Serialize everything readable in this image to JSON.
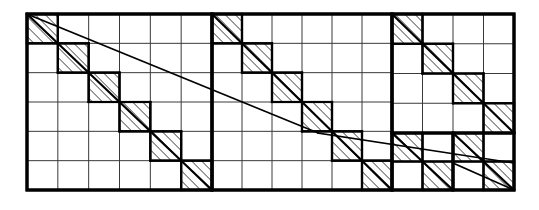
{
  "figure": {
    "type": "diagram",
    "canvas": {
      "width": 539,
      "height": 210
    },
    "frame": {
      "x": 27,
      "y": 14,
      "width": 487,
      "height": 176
    },
    "colors": {
      "background": "#ffffff",
      "stroke_heavy": "#000000",
      "stroke_light": "#3a3a3a",
      "hatch": "#000000"
    },
    "stroke_widths": {
      "outer_frame": 3.0,
      "panel_divider": 3.0,
      "cell_border_heavy": 2.2,
      "grid_line": 1.0,
      "diagonal": 2.2,
      "shallow_line": 1.6
    },
    "panels": [
      {
        "id": "panel-1",
        "label": "left panel",
        "x": 27,
        "y": 14,
        "width": 185,
        "height": 176,
        "grid": {
          "cols": 6,
          "rows": 6
        },
        "hatched_cells": [
          [
            0,
            0
          ],
          [
            1,
            1
          ],
          [
            2,
            2
          ],
          [
            3,
            3
          ],
          [
            4,
            4
          ],
          [
            5,
            5
          ]
        ],
        "diagonal": {
          "from": [
            0,
            0
          ],
          "to": [
            6,
            6
          ]
        }
      },
      {
        "id": "panel-2",
        "label": "middle panel",
        "x": 212,
        "y": 14,
        "width": 180,
        "height": 176,
        "grid": {
          "cols": 6,
          "rows": 6
        },
        "hatched_cells": [
          [
            0,
            0
          ],
          [
            1,
            1
          ],
          [
            2,
            2
          ],
          [
            3,
            3
          ],
          [
            4,
            4
          ],
          [
            5,
            5
          ]
        ],
        "diagonal": {
          "from": [
            0,
            0
          ],
          "to": [
            6,
            6
          ]
        }
      },
      {
        "id": "panel-3",
        "label": "right panel",
        "x": 392,
        "y": 14,
        "width": 122,
        "height": 176,
        "upper_block": {
          "x": 392,
          "y": 14,
          "width": 122,
          "height": 119,
          "grid": {
            "cols": 4,
            "rows": 4
          },
          "hatched_cells": [
            [
              0,
              0
            ],
            [
              1,
              1
            ],
            [
              2,
              2
            ],
            [
              3,
              3
            ]
          ],
          "diagonal": {
            "from": [
              0,
              0
            ],
            "to": [
              4,
              4
            ]
          }
        },
        "lower_blocks": [
          {
            "id": "panel-3-lower-left",
            "x": 392,
            "y": 133,
            "width": 61,
            "height": 57,
            "grid": {
              "cols": 2,
              "rows": 2
            },
            "hatched_cells": [
              [
                0,
                0
              ],
              [
                1,
                1
              ]
            ],
            "diagonal": {
              "from": [
                0,
                0
              ],
              "to": [
                2,
                2
              ]
            }
          },
          {
            "id": "panel-3-lower-right",
            "x": 453,
            "y": 133,
            "width": 61,
            "height": 57,
            "grid": {
              "cols": 2,
              "rows": 2
            },
            "hatched_cells": [
              [
                0,
                0
              ],
              [
                1,
                1
              ]
            ],
            "diagonal": {
              "from": [
                0,
                0
              ],
              "to": [
                2,
                2
              ]
            }
          }
        ]
      }
    ],
    "shallow_line": {
      "description": "single slanted line running from top-left corner of the figure down through all three panels",
      "segments": [
        {
          "from": [
            27,
            14
          ],
          "to": [
            318,
            133
          ]
        },
        {
          "from": [
            318,
            133
          ],
          "to": [
            514,
            163
          ]
        },
        {
          "from": [
            453,
            163
          ],
          "to": [
            514,
            190
          ]
        }
      ]
    },
    "hatch_pattern": {
      "direction": "diagonal-45-up-right",
      "spacing_px": 5,
      "line_width": 1.1
    }
  }
}
